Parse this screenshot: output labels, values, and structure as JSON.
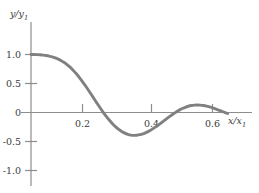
{
  "figure": {
    "background_color": "#ffffff",
    "axis_color": "#8d8d8d",
    "curve_color": "#808080",
    "curve_width": 2.9,
    "text_color": "#3b3b3b"
  },
  "axes": {
    "y_axis_title_main": "y/y",
    "y_axis_title_sub": "1",
    "x_axis_title_main": "x/x",
    "x_axis_title_sub": "1"
  },
  "chart_data": {
    "type": "line",
    "title": "",
    "subtitle": "",
    "xlabel": "x/x₁",
    "ylabel": "y/y₁",
    "xlim": [
      0.0,
      0.68
    ],
    "ylim": [
      -1.15,
      1.15
    ],
    "grid": false,
    "legend": null,
    "legend_position": "none",
    "x_ticks": [
      0.2,
      0.4,
      0.6
    ],
    "x_tick_labels": [
      "0.2",
      "0.4",
      "0.6"
    ],
    "y_ticks": [
      1.0,
      0.5,
      0.0,
      -0.5,
      -1.0
    ],
    "y_tick_labels": [
      "1.0",
      "0.5",
      "0",
      "-0.5",
      "-1.0"
    ],
    "series": [
      {
        "name": "damped oscillation",
        "color": "#808080",
        "x": [
          0.0,
          0.01,
          0.02,
          0.03,
          0.04,
          0.05,
          0.06,
          0.07,
          0.08,
          0.09,
          0.1,
          0.11,
          0.12,
          0.13,
          0.14,
          0.15,
          0.16,
          0.17,
          0.18,
          0.19,
          0.2,
          0.21,
          0.22,
          0.23,
          0.24,
          0.25,
          0.26,
          0.27,
          0.28,
          0.29,
          0.3,
          0.31,
          0.32,
          0.33,
          0.34,
          0.35,
          0.36,
          0.37,
          0.38,
          0.39,
          0.4,
          0.41,
          0.42,
          0.43,
          0.44,
          0.45,
          0.46,
          0.47,
          0.48,
          0.49,
          0.5,
          0.51,
          0.52,
          0.53,
          0.54,
          0.55,
          0.56,
          0.57,
          0.58,
          0.59,
          0.6,
          0.61,
          0.62,
          0.63,
          0.64,
          0.65
        ],
        "y": [
          1.0,
          1.0,
          0.998,
          0.995,
          0.99,
          0.983,
          0.973,
          0.96,
          0.943,
          0.921,
          0.894,
          0.861,
          0.822,
          0.777,
          0.725,
          0.667,
          0.603,
          0.534,
          0.461,
          0.384,
          0.305,
          0.225,
          0.146,
          0.069,
          -0.005,
          -0.075,
          -0.139,
          -0.197,
          -0.248,
          -0.292,
          -0.328,
          -0.356,
          -0.376,
          -0.389,
          -0.394,
          -0.392,
          -0.383,
          -0.368,
          -0.347,
          -0.321,
          -0.291,
          -0.257,
          -0.22,
          -0.181,
          -0.141,
          -0.101,
          -0.062,
          -0.025,
          0.01,
          0.041,
          0.068,
          0.09,
          0.108,
          0.12,
          0.127,
          0.129,
          0.127,
          0.12,
          0.11,
          0.096,
          0.079,
          0.061,
          0.042,
          0.022,
          0.002,
          -0.017
        ],
        "key_points": {
          "start_value": 1.0,
          "first_zero_crossing": 0.239,
          "first_minimum_x": 0.335,
          "first_minimum_y": -0.46,
          "second_zero_crossing": 0.432,
          "first_maximum_x": 0.503,
          "first_maximum_y": 0.2,
          "third_zero_crossing": 0.565,
          "second_minimum_x": 0.605,
          "second_minimum_y": -0.1,
          "end_x": 0.652,
          "end_y": 0.03
        }
      }
    ]
  }
}
